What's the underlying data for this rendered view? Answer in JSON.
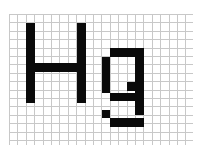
{
  "figure": {
    "text": "Hg",
    "colors": {
      "background": "#ffffff",
      "grid": "#c8c8c8",
      "ink": "#0a0a0a"
    }
  },
  "grid": {
    "x0": 9,
    "y0": 14,
    "pitch": 8.4,
    "x_end": 193,
    "y_end": 145,
    "cols": 22,
    "rows": 16
  },
  "glyphs": [
    {
      "char": "H",
      "rects": [
        {
          "x": 26,
          "y": 23,
          "w": 9,
          "h": 80
        },
        {
          "x": 77,
          "y": 23,
          "w": 9,
          "h": 80
        },
        {
          "x": 35,
          "y": 63,
          "w": 42,
          "h": 9
        }
      ]
    },
    {
      "char": "g",
      "rects": [
        {
          "x": 110,
          "y": 48,
          "w": 25,
          "h": 9
        },
        {
          "x": 102,
          "y": 57,
          "w": 8,
          "h": 36
        },
        {
          "x": 135,
          "y": 48,
          "w": 9,
          "h": 67
        },
        {
          "x": 127,
          "y": 82,
          "w": 8,
          "h": 9
        },
        {
          "x": 110,
          "y": 93,
          "w": 25,
          "h": 8
        },
        {
          "x": 102,
          "y": 110,
          "w": 8,
          "h": 8
        },
        {
          "x": 110,
          "y": 118,
          "w": 34,
          "h": 9
        }
      ]
    }
  ]
}
